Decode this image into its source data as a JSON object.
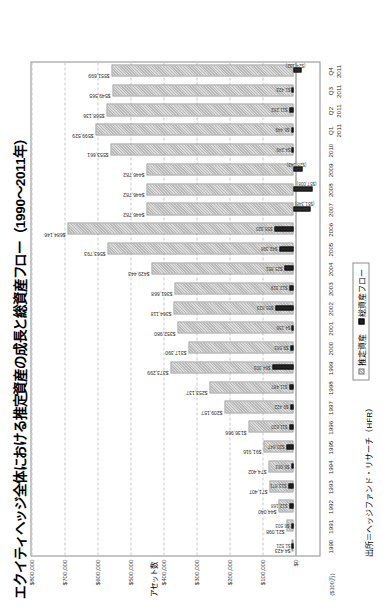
{
  "chart": {
    "title": "エクイティヘッジ全体における推定資産の成長と総資産フロー（1990～2011年）",
    "yaxis_caption": "アセット数",
    "units_note": "($100万)",
    "source": "出所＝ヘッジファンド・リサーチ（HFR）",
    "legend": {
      "assets_label": "推定資産",
      "flow_label": "総資産フロー"
    }
  },
  "chart_data": {
    "type": "bar",
    "title": "エクイティヘッジ全体における推定資産の成長と総資産フロー（1990～2011年）",
    "xlabel": "",
    "ylabel": "アセット数",
    "ylim": [
      0,
      800000
    ],
    "grid": true,
    "legend_position": "bottom",
    "yticks": [
      "$0",
      "$100,000",
      "$200,000",
      "$300,000",
      "$400,000",
      "$500,000",
      "$600,000",
      "$700,000",
      "$800,000"
    ],
    "ytick_values": [
      0,
      100000,
      200000,
      300000,
      400000,
      500000,
      600000,
      700000,
      800000
    ],
    "categories": [
      "1990",
      "1991",
      "1992",
      "1993",
      "1994",
      "1995",
      "1996",
      "1997",
      "1998",
      "1999",
      "2000",
      "2001",
      "2002",
      "2003",
      "2004",
      "2005",
      "2006",
      "2007",
      "2008",
      "2009",
      "2010",
      "2011 Q1",
      "2011 Q2",
      "2011 Q3",
      "2011 Q4"
    ],
    "series": [
      {
        "name": "推定資産",
        "values": [
          4423,
          21098,
          44040,
          71407,
          74402,
          91916,
          136966,
          209157,
          253137,
          373299,
          317390,
          352980,
          364118,
          361668,
          429443,
          563793,
          684146,
          446782,
          446782,
          446782,
          553661,
          599529,
          568136,
          549565,
          551699
        ],
        "labels": [
          "$4,423",
          "$21,098",
          "$44,040",
          "$71,407",
          "$74,402",
          "$91,916",
          "$136,966",
          "$209,157",
          "$253,137",
          "$373,299",
          "$317,390",
          "$352,980",
          "$364,118",
          "$361,668",
          "$429,443",
          "$563,793",
          "$684,146",
          "$446,782",
          "$446,782",
          "$446,782",
          "$553,661",
          "$599,529",
          "$568,136",
          "$549,565",
          "$551,699"
        ]
      },
      {
        "name": "総資産フロー",
        "values": [
          1521,
          6503,
          12168,
          13871,
          6063,
          20847,
          11820,
          9422,
          11487,
          64303,
          9583,
          4156,
          55823,
          12319,
          25851,
          42398,
          58320,
          -51348,
          -57008,
          -28143,
          4249,
          6449,
          11262,
          1423,
          -24132
        ],
        "labels": [
          "$1,521",
          "$6,503",
          "$12,168",
          "$13,871",
          "$6,063",
          "$20,847",
          "$11,820",
          "$9,422",
          "$11,487",
          "$64,303",
          "$9,583",
          "$4,156",
          "$55,823",
          "$12,319",
          "$25,851",
          "$42,398",
          "$58,320",
          "($51,348)",
          "($57,008)",
          "($28,143)",
          "$4,249",
          "$6,449",
          "$11,262",
          "$1,423",
          "($24,132)"
        ]
      }
    ]
  }
}
